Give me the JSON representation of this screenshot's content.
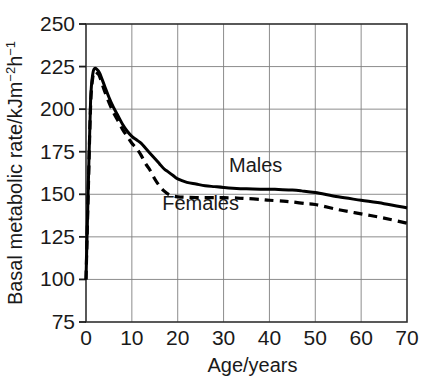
{
  "chart_data": {
    "type": "line",
    "title": "",
    "xlabel": "Age/years",
    "ylabel": "Basal metabolic rate/kJm⁻²h⁻¹",
    "ylabel_parts": {
      "pre": "Basal metabolic rate/kJm",
      "sup1": "−2",
      "mid": "h",
      "sup2": "−1"
    },
    "xlim": [
      0,
      70
    ],
    "ylim": [
      75,
      250
    ],
    "xticks": [
      "0",
      "10",
      "20",
      "30",
      "40",
      "50",
      "60",
      "70"
    ],
    "xtick_values": [
      0,
      10,
      20,
      30,
      40,
      50,
      60,
      70
    ],
    "yticks": [
      "75",
      "100",
      "125",
      "150",
      "175",
      "200",
      "225",
      "250"
    ],
    "ytick_values": [
      75,
      100,
      125,
      150,
      175,
      200,
      225,
      250
    ],
    "grid": true,
    "legend_position": "inline-annotation",
    "line_color": "#000000",
    "grid_color": "#808080",
    "axis_color": "#1a1a1a",
    "series": [
      {
        "name": "Males",
        "style": "solid",
        "label_x": 37,
        "label_y": 163,
        "x": [
          0,
          0.5,
          1,
          1.5,
          2,
          2.5,
          3,
          4,
          5,
          6,
          7,
          8,
          9,
          10,
          11,
          12,
          13,
          14,
          15,
          16,
          17,
          18,
          19,
          20,
          22,
          24,
          26,
          28,
          30,
          32,
          35,
          38,
          40,
          42,
          45,
          47,
          50,
          55,
          60,
          65,
          70
        ],
        "y": [
          100,
          155,
          205,
          221,
          224,
          223,
          221,
          214,
          207,
          201,
          196,
          191,
          187,
          184,
          182,
          180,
          177,
          174,
          171,
          168,
          165,
          163,
          161,
          159,
          157,
          156,
          155,
          154.5,
          154,
          153.6,
          153.2,
          153,
          153,
          152.8,
          152.5,
          152,
          151,
          148.5,
          146.5,
          144.5,
          142
        ]
      },
      {
        "name": "Females",
        "style": "dashed",
        "label_x": 25,
        "label_y": 141,
        "x": [
          0,
          0.5,
          1,
          1.5,
          2,
          2.5,
          3,
          4,
          5,
          6,
          7,
          8,
          9,
          10,
          11,
          12,
          13,
          14,
          15,
          16,
          17,
          18,
          19,
          20,
          22,
          25,
          28,
          30,
          33,
          35,
          38,
          40,
          43,
          45,
          48,
          50,
          55,
          60,
          65,
          70
        ],
        "y": [
          100,
          152,
          202,
          219,
          222,
          221,
          219,
          211,
          204,
          198,
          193,
          188,
          184,
          180,
          177,
          173,
          168,
          164,
          159,
          155,
          152,
          150,
          149,
          148.5,
          148.2,
          148,
          148,
          148,
          147.8,
          147.5,
          147,
          146.5,
          146,
          145.5,
          144.5,
          144,
          141,
          138.5,
          136,
          133
        ]
      }
    ],
    "annotations": [
      {
        "text": "Males",
        "series": "Males"
      },
      {
        "text": "Females",
        "series": "Females"
      }
    ]
  },
  "plot_geometry": {
    "left": 86,
    "top": 24,
    "right": 407,
    "bottom": 322
  }
}
